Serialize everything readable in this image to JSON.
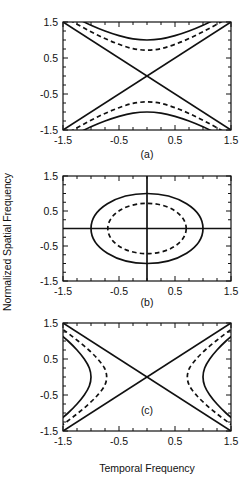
{
  "figure": {
    "axis_labels": {
      "y": "Normalized Spatial Frequency",
      "x": "Temporal Frequency"
    },
    "panel_labels": [
      "(a)",
      "(b)",
      "(c)"
    ],
    "tick_labels": {
      "x": [
        "-1.5",
        "-0.5",
        "0.5",
        "1.5"
      ],
      "y": [
        "1.5",
        "0.5",
        "-0.5",
        "-1.5"
      ]
    },
    "colors": {
      "ink": "#111111",
      "background": "#ffffff"
    }
  },
  "chart_data": [
    {
      "type": "line",
      "title": "(a)",
      "xlabel": "Temporal Frequency",
      "ylabel": "Normalized Spatial Frequency",
      "xlim": [
        -1.5,
        1.5
      ],
      "ylim": [
        -1.5,
        1.5
      ],
      "xticks": [
        -1.5,
        -0.5,
        0.5,
        1.5
      ],
      "yticks": [
        -1.5,
        -0.5,
        0.5,
        1.5
      ],
      "grid": false,
      "legend": "none",
      "annotations": [
        "vertical-opening hyperbolas with diagonal asymptotes"
      ],
      "series": [
        {
          "name": "solid hyperbola upper branch",
          "style": "solid",
          "x": [
            -1.5,
            -1.25,
            -1.0,
            -0.75,
            -0.5,
            -0.25,
            0.0,
            0.25,
            0.5,
            0.75,
            1.0,
            1.25,
            1.5
          ],
          "y": [
            1.8,
            1.6,
            1.41,
            1.25,
            1.12,
            1.03,
            1.0,
            1.03,
            1.12,
            1.25,
            1.41,
            1.6,
            1.8
          ]
        },
        {
          "name": "solid hyperbola lower branch",
          "style": "solid",
          "x": [
            -1.5,
            -1.25,
            -1.0,
            -0.75,
            -0.5,
            -0.25,
            0.0,
            0.25,
            0.5,
            0.75,
            1.0,
            1.25,
            1.5
          ],
          "y": [
            -1.8,
            -1.6,
            -1.41,
            -1.25,
            -1.12,
            -1.03,
            -1.0,
            -1.03,
            -1.12,
            -1.25,
            -1.41,
            -1.6,
            -1.8
          ]
        },
        {
          "name": "dashed hyperbola upper branch",
          "style": "dashed",
          "x": [
            -1.5,
            -1.25,
            -1.0,
            -0.75,
            -0.5,
            -0.25,
            0.0,
            0.25,
            0.5,
            0.75,
            1.0,
            1.25,
            1.5
          ],
          "y": [
            1.66,
            1.44,
            1.23,
            1.04,
            0.88,
            0.76,
            0.72,
            0.76,
            0.88,
            1.04,
            1.23,
            1.44,
            1.66
          ]
        },
        {
          "name": "dashed hyperbola lower branch",
          "style": "dashed",
          "x": [
            -1.5,
            -1.25,
            -1.0,
            -0.75,
            -0.5,
            -0.25,
            0.0,
            0.25,
            0.5,
            0.75,
            1.0,
            1.25,
            1.5
          ],
          "y": [
            -1.66,
            -1.44,
            -1.23,
            -1.04,
            -0.88,
            -0.76,
            -0.72,
            -0.76,
            -0.88,
            -1.04,
            -1.23,
            -1.44,
            -1.66
          ]
        },
        {
          "name": "asymptote positive slope",
          "style": "solid",
          "x": [
            -1.5,
            1.5
          ],
          "y": [
            -1.5,
            1.5
          ]
        },
        {
          "name": "asymptote negative slope",
          "style": "solid",
          "x": [
            -1.5,
            1.5
          ],
          "y": [
            1.5,
            -1.5
          ]
        }
      ]
    },
    {
      "type": "line",
      "title": "(b)",
      "xlabel": "Temporal Frequency",
      "ylabel": "Normalized Spatial Frequency",
      "xlim": [
        -1.5,
        1.5
      ],
      "ylim": [
        -1.5,
        1.5
      ],
      "xticks": [
        -1.5,
        -0.5,
        0.5,
        1.5
      ],
      "yticks": [
        -1.5,
        -0.5,
        0.5,
        1.5
      ],
      "grid": false,
      "legend": "none",
      "annotations": [
        "concentric ellipses centred on origin; axis cross-hairs through origin"
      ],
      "series": [
        {
          "name": "solid ellipse",
          "style": "solid",
          "semi_axis_x": 1.0,
          "semi_axis_y": 1.0,
          "center": [
            0.0,
            0.0
          ]
        },
        {
          "name": "dashed ellipse",
          "style": "dashed",
          "semi_axis_x": 0.7,
          "semi_axis_y": 0.72,
          "center": [
            0.0,
            0.0
          ]
        },
        {
          "name": "horizontal axis line",
          "style": "solid",
          "x": [
            -1.5,
            1.5
          ],
          "y": [
            0.0,
            0.0
          ]
        },
        {
          "name": "vertical axis line",
          "style": "solid",
          "x": [
            0.0,
            0.0
          ],
          "y": [
            -1.5,
            1.5
          ]
        }
      ]
    },
    {
      "type": "line",
      "title": "(c)",
      "xlabel": "Temporal Frequency",
      "ylabel": "Normalized Spatial Frequency",
      "xlim": [
        -1.5,
        1.5
      ],
      "ylim": [
        -1.5,
        1.5
      ],
      "xticks": [
        -1.5,
        -0.5,
        0.5,
        1.5
      ],
      "yticks": [
        -1.5,
        -0.5,
        0.5,
        1.5
      ],
      "grid": false,
      "legend": "none",
      "annotations": [
        "horizontal-opening hyperbolas with diagonal asymptotes"
      ],
      "series": [
        {
          "name": "solid hyperbola right branch",
          "style": "solid",
          "y": [
            -1.5,
            -1.25,
            -1.0,
            -0.75,
            -0.5,
            -0.25,
            0.0,
            0.25,
            0.5,
            0.75,
            1.0,
            1.25,
            1.5
          ],
          "x": [
            1.8,
            1.6,
            1.41,
            1.25,
            1.12,
            1.03,
            1.0,
            1.03,
            1.12,
            1.25,
            1.41,
            1.6,
            1.8
          ]
        },
        {
          "name": "solid hyperbola left branch",
          "style": "solid",
          "y": [
            -1.5,
            -1.25,
            -1.0,
            -0.75,
            -0.5,
            -0.25,
            0.0,
            0.25,
            0.5,
            0.75,
            1.0,
            1.25,
            1.5
          ],
          "x": [
            -1.8,
            -1.6,
            -1.41,
            -1.25,
            -1.12,
            -1.03,
            -1.0,
            -1.03,
            -1.12,
            -1.25,
            -1.41,
            -1.6,
            -1.8
          ]
        },
        {
          "name": "dashed hyperbola right branch",
          "style": "dashed",
          "y": [
            -1.5,
            -1.25,
            -1.0,
            -0.75,
            -0.5,
            -0.25,
            0.0,
            0.25,
            0.5,
            0.75,
            1.0,
            1.25,
            1.5
          ],
          "x": [
            1.66,
            1.44,
            1.23,
            1.04,
            0.88,
            0.76,
            0.72,
            0.76,
            0.88,
            1.04,
            1.23,
            1.44,
            1.66
          ]
        },
        {
          "name": "dashed hyperbola left branch",
          "style": "dashed",
          "y": [
            -1.5,
            -1.25,
            -1.0,
            -0.75,
            -0.5,
            -0.25,
            0.0,
            0.25,
            0.5,
            0.75,
            1.0,
            1.25,
            1.5
          ],
          "x": [
            -1.66,
            -1.44,
            -1.23,
            -1.04,
            -0.88,
            -0.76,
            -0.72,
            -0.76,
            -0.88,
            -1.04,
            -1.23,
            -1.44,
            -1.66
          ]
        },
        {
          "name": "asymptote positive slope",
          "style": "solid",
          "x": [
            -1.5,
            1.5
          ],
          "y": [
            -1.5,
            1.5
          ]
        },
        {
          "name": "asymptote negative slope",
          "style": "solid",
          "x": [
            -1.5,
            1.5
          ],
          "y": [
            1.5,
            -1.5
          ]
        }
      ]
    }
  ]
}
